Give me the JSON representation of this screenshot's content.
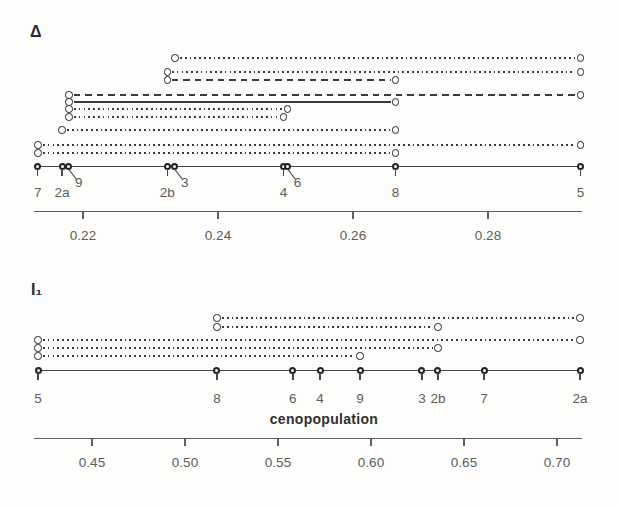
{
  "figure": {
    "background": "#fdfdfb"
  },
  "colors": {
    "interval_line": "#3a3a3a",
    "main_line": "#464646",
    "marker_ring": "#222222",
    "marker_fill": "#ffffff",
    "axis": "#5f5f5f",
    "text": "#5c5c5c",
    "panel_title": "#2b2b2b",
    "xlabel_text": "#303030"
  },
  "chart_data": [
    {
      "type": "scatter",
      "subtype": "one-dimensional dot plot with pairwise homogeneity intervals",
      "title": "Δ",
      "xlabel": "",
      "axis": {
        "tick_values": [
          0.22,
          0.24,
          0.26,
          0.28
        ],
        "tick_labels": [
          "0.22",
          "0.24",
          "0.26",
          "0.28"
        ],
        "range": [
          0.2126,
          0.2939
        ],
        "grid": false
      },
      "points": [
        {
          "label": "7",
          "value": 0.2133,
          "label_style": "below"
        },
        {
          "label": "2a",
          "value": 0.2169,
          "label_style": "below"
        },
        {
          "label": "9",
          "value": 0.2179,
          "label_style": "diagonal"
        },
        {
          "label": "2b",
          "value": 0.2325,
          "label_style": "below"
        },
        {
          "label": "3",
          "value": 0.2336,
          "label_style": "diagonal"
        },
        {
          "label": "4",
          "value": 0.2497,
          "label_style": "below"
        },
        {
          "label": "6",
          "value": 0.2503,
          "label_style": "diagonal"
        },
        {
          "label": "8",
          "value": 0.2663,
          "label_style": "below"
        },
        {
          "label": "5",
          "value": 0.2937,
          "label_style": "below"
        }
      ],
      "intervals": [
        {
          "from": "3",
          "to": "5",
          "style": "dotted"
        },
        {
          "from": "2b",
          "to": "5",
          "style": "dotted"
        },
        {
          "from": "2b",
          "to": "8",
          "style": "dashed"
        },
        {
          "from": "9",
          "to": "5",
          "style": "dashed"
        },
        {
          "from": "9",
          "to": "8",
          "style": "solid"
        },
        {
          "from": "9",
          "to": "6",
          "style": "dotted"
        },
        {
          "from": "9",
          "to": "4",
          "style": "dotted"
        },
        {
          "from": "2a",
          "to": "8",
          "style": "dotted"
        },
        {
          "from": "7",
          "to": "5",
          "style": "dotted"
        },
        {
          "from": "7",
          "to": "8",
          "style": "dotted"
        }
      ]
    },
    {
      "type": "scatter",
      "subtype": "one-dimensional dot plot with pairwise homogeneity intervals",
      "title": "I₁",
      "xlabel": "cenopopulation",
      "axis": {
        "tick_values": [
          0.45,
          0.5,
          0.55,
          0.6,
          0.65,
          0.7
        ],
        "tick_labels": [
          "0.45",
          "0.50",
          "0.55",
          "0.60",
          "0.65",
          "0.70"
        ],
        "range": [
          0.4187,
          0.7137
        ],
        "grid": false
      },
      "points": [
        {
          "label": "5",
          "value": 0.421,
          "label_style": "below"
        },
        {
          "label": "8",
          "value": 0.5172,
          "label_style": "below"
        },
        {
          "label": "6",
          "value": 0.558,
          "label_style": "below"
        },
        {
          "label": "4",
          "value": 0.5726,
          "label_style": "below"
        },
        {
          "label": "9",
          "value": 0.5941,
          "label_style": "below"
        },
        {
          "label": "3",
          "value": 0.6274,
          "label_style": "below"
        },
        {
          "label": "2b",
          "value": 0.636,
          "label_style": "below"
        },
        {
          "label": "7",
          "value": 0.6608,
          "label_style": "below"
        },
        {
          "label": "2a",
          "value": 0.7124,
          "label_style": "below"
        }
      ],
      "intervals": [
        {
          "from": "8",
          "to": "2a",
          "style": "dotted"
        },
        {
          "from": "8",
          "to": "2b",
          "style": "dotted"
        },
        {
          "from": "5",
          "to": "2a",
          "style": "dotted"
        },
        {
          "from": "5",
          "to": "2b",
          "style": "dotted"
        },
        {
          "from": "5",
          "to": "9",
          "style": "dotted"
        }
      ]
    }
  ]
}
